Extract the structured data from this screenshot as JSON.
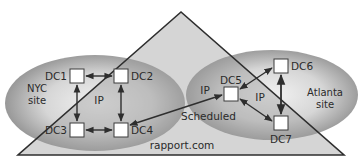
{
  "diagram": {
    "domain_label": "rapport.com",
    "sites": [
      {
        "name_line1": "NYC",
        "name_line2": "site",
        "link_label": "IP"
      },
      {
        "name_line1": "Atlanta",
        "name_line2": "site",
        "link_label": "IP"
      }
    ],
    "domain_controllers": [
      "DC1",
      "DC2",
      "DC3",
      "DC4",
      "DC5",
      "DC6",
      "DC7"
    ],
    "inter_site_link": {
      "label": "Scheduled",
      "transport": "IP"
    },
    "links": [
      {
        "from": "DC1",
        "to": "DC2"
      },
      {
        "from": "DC1",
        "to": "DC3"
      },
      {
        "from": "DC2",
        "to": "DC4"
      },
      {
        "from": "DC3",
        "to": "DC4"
      },
      {
        "from": "DC4",
        "to": "DC5"
      },
      {
        "from": "DC5",
        "to": "DC6"
      },
      {
        "from": "DC5",
        "to": "DC7"
      },
      {
        "from": "DC6",
        "to": "DC7"
      }
    ],
    "colors": {
      "triangle_fill": "#c4c4c4",
      "ellipse_edge": "#8e8e8e",
      "ellipse_center": "#ececec",
      "stroke": "#2e2e2e",
      "box_fill": "#ffffff"
    }
  }
}
